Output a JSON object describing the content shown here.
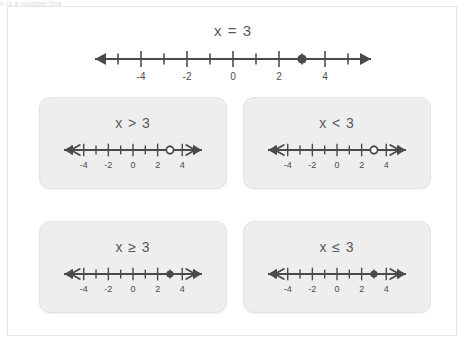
{
  "top_text": "x is a number line",
  "main": {
    "title": "x = 3",
    "line": {
      "min": -6,
      "max": 6,
      "tick_labels": [
        {
          "value": -4,
          "text": "-4"
        },
        {
          "value": -2,
          "text": "-2"
        },
        {
          "value": 0,
          "text": "0"
        },
        {
          "value": 2,
          "text": "2"
        },
        {
          "value": 4,
          "text": "4"
        }
      ],
      "point": {
        "value": 3,
        "style": "filled"
      },
      "ray": "none",
      "left_arrow": "single",
      "right_arrow": "single"
    }
  },
  "cards": [
    {
      "title": "x > 3",
      "name": "greater-than",
      "line": {
        "min": -5.6,
        "max": 5.6,
        "tick_labels": [
          {
            "value": -4,
            "text": "-4"
          },
          {
            "value": -2,
            "text": "-2"
          },
          {
            "value": 0,
            "text": "0"
          },
          {
            "value": 2,
            "text": "2"
          },
          {
            "value": 4,
            "text": "4"
          }
        ],
        "point": {
          "value": 3,
          "style": "open"
        },
        "ray": "none",
        "left_arrow": "double",
        "right_arrow": "double"
      }
    },
    {
      "title": "x < 3",
      "name": "less-than",
      "line": {
        "min": -5.6,
        "max": 5.6,
        "tick_labels": [
          {
            "value": -4,
            "text": "-4"
          },
          {
            "value": -2,
            "text": "-2"
          },
          {
            "value": 0,
            "text": "0"
          },
          {
            "value": 2,
            "text": "2"
          },
          {
            "value": 4,
            "text": "4"
          }
        ],
        "point": {
          "value": 3,
          "style": "open"
        },
        "ray": "none",
        "left_arrow": "double",
        "right_arrow": "double"
      }
    },
    {
      "title": "x ≥ 3",
      "name": "greater-than-or-equal",
      "line": {
        "min": -5.6,
        "max": 5.6,
        "tick_labels": [
          {
            "value": -4,
            "text": "-4"
          },
          {
            "value": -2,
            "text": "-2"
          },
          {
            "value": 0,
            "text": "0"
          },
          {
            "value": 2,
            "text": "2"
          },
          {
            "value": 4,
            "text": "4"
          }
        ],
        "point": {
          "value": 3,
          "style": "filled"
        },
        "ray": "none",
        "left_arrow": "double",
        "right_arrow": "double"
      }
    },
    {
      "title": "x ≤ 3",
      "name": "less-than-or-equal",
      "line": {
        "min": -5.6,
        "max": 5.6,
        "tick_labels": [
          {
            "value": -4,
            "text": "-4"
          },
          {
            "value": -2,
            "text": "-2"
          },
          {
            "value": 0,
            "text": "0"
          },
          {
            "value": 2,
            "text": "2"
          },
          {
            "value": 4,
            "text": "4"
          }
        ],
        "point": {
          "value": 3,
          "style": "filled"
        },
        "ray": "none",
        "left_arrow": "double",
        "right_arrow": "double"
      }
    }
  ],
  "colors": {
    "line": "#4a4a4e",
    "text": "#58585c",
    "card_bg": "#eeeeef",
    "page_bg": "#ffffff",
    "frame": "#e6e6e8"
  }
}
